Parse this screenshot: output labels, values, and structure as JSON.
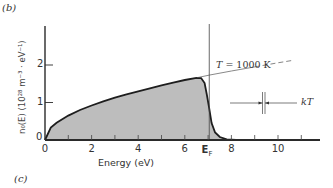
{
  "figure": {
    "panel_label_top": "(b)",
    "panel_label_bottom": "(c)",
    "temperature_label": "T = 1000 K",
    "temperature_symbol": "T",
    "temperature_value": "= 1000 K",
    "kt_label": "kT",
    "fermi_label_main": "E",
    "fermi_label_sub": "F",
    "colors": {
      "fill": "#bdbdbd",
      "curve": "#1e1e1e",
      "axis": "#2a2a2a",
      "thin_line": "#555555"
    }
  },
  "chart_data": {
    "type": "area",
    "title": "",
    "xlabel": "Energy (eV)",
    "ylabel": "n0(E) (10^28 m^-3 · eV^-1)",
    "ylabel_display": "n₀(E) (10²⁸ m⁻³ · eV⁻¹)",
    "xlim": [
      0,
      11.8
    ],
    "ylim": [
      0,
      2.4
    ],
    "x_ticks": [
      0,
      2,
      4,
      6,
      8,
      10
    ],
    "x_minor_ticks": [
      1,
      3,
      5,
      7,
      9,
      11
    ],
    "x_tick_labels": [
      "0",
      "2",
      "4",
      "6",
      "8",
      "10"
    ],
    "y_ticks": [
      0,
      1,
      2
    ],
    "y_tick_labels": [
      "0",
      "1",
      "2"
    ],
    "grid": false,
    "legend": null,
    "annotations": [
      {
        "text": "T = 1000 K",
        "x": 8.2,
        "y": 1.6
      },
      {
        "text": "E_F",
        "x": 7.05,
        "y": 0,
        "note": "Fermi energy marker on x-axis with vertical line"
      },
      {
        "text": "kT",
        "x": 11.2,
        "y": 1.0,
        "note": "width marker between two close vertical lines"
      }
    ],
    "fermi_energy_eV": 7.05,
    "temperature_K": 1000,
    "series": [
      {
        "name": "n0(E) at T = 1000 K (shaded, occupied states)",
        "style": "solid filled",
        "x": [
          0,
          0.25,
          0.5,
          1,
          1.5,
          2,
          2.5,
          3,
          3.5,
          4,
          4.5,
          5,
          5.5,
          6,
          6.5,
          6.7,
          6.85,
          6.95,
          7.05,
          7.15,
          7.3,
          7.5,
          7.8,
          8.2,
          9,
          10,
          11.8
        ],
        "values": [
          0,
          0.33,
          0.46,
          0.65,
          0.8,
          0.92,
          1.03,
          1.13,
          1.22,
          1.3,
          1.38,
          1.46,
          1.53,
          1.6,
          1.66,
          1.65,
          1.52,
          1.2,
          0.83,
          0.45,
          0.2,
          0.08,
          0.02,
          0.005,
          0,
          0,
          0
        ]
      },
      {
        "name": "Density of states g(E) ∝ √E (extension beyond E_F)",
        "style": "thin solid then dashed",
        "x": [
          6.5,
          7.05,
          8,
          9,
          10,
          10.6
        ],
        "values": [
          1.66,
          1.73,
          1.84,
          1.95,
          2.06,
          2.12
        ]
      }
    ]
  }
}
